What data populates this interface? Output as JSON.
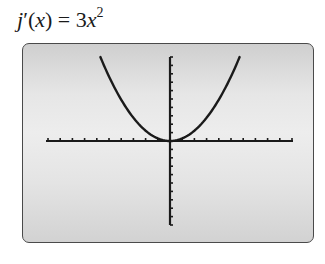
{
  "title": {
    "func": "j",
    "prime": "′",
    "var": "x",
    "equals": " = 3",
    "var2": "x",
    "exp": "2"
  },
  "colors": {
    "curve": "#1a1a1a",
    "axis": "#1a1a1a",
    "screen_border": "#4a4a4a"
  },
  "chart_data": {
    "type": "line",
    "xlabel": "",
    "ylabel": "",
    "function": "3x^2",
    "series": [
      {
        "name": "j'(x) = 3x^2",
        "x": [
          -1.83,
          -1.5,
          -1.0,
          -0.5,
          0,
          0.5,
          1.0,
          1.5,
          1.83
        ],
        "y": [
          10.0,
          6.75,
          3.0,
          0.75,
          0,
          0.75,
          3.0,
          6.75,
          10.0
        ]
      }
    ],
    "xlim": [
      -3.2,
      3.2
    ],
    "ylim": [
      -10,
      10
    ],
    "x_ticks_each_side": 10,
    "y_ticks_each_side": 10,
    "grid": false,
    "legend": "none",
    "style": "graphing-calculator screen"
  }
}
